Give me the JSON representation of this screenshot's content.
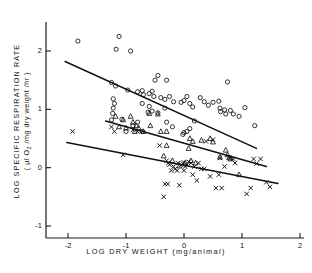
{
  "figure": {
    "xlabel": "LOG  DRY  WEIGHT  (mg/animal)",
    "ylabel_line1": "LOG  SPECIFIC  RESPIRATION  RATE",
    "ylabel_line2": "( µl O2 /mg dry weight /hr )",
    "caption": ""
  },
  "axes": {
    "x_ticks": [
      "-2",
      "-1",
      "0",
      "1",
      "2"
    ],
    "y_ticks": [
      "2",
      "1",
      "0",
      "-1"
    ]
  },
  "chart_data": {
    "type": "scatter",
    "title": "",
    "xlabel": "LOG DRY WEIGHT (mg/animal)",
    "ylabel": "LOG SPECIFIC RESPIRATION RATE (µl O2 /mg dry weight /hr)",
    "xlim": [
      -2.2,
      2.0
    ],
    "ylim": [
      -1.15,
      2.4
    ],
    "grid": false,
    "legend": "none",
    "x_ticks": [
      -2,
      -1,
      0,
      1,
      2
    ],
    "y_ticks": [
      2,
      1,
      0,
      -1
    ],
    "series": [
      {
        "name": "circles",
        "marker": "open-circle",
        "points": [
          [
            -1.83,
            2.17
          ],
          [
            -1.12,
            2.25
          ],
          [
            -1.17,
            2.03
          ],
          [
            -0.92,
            2.0
          ],
          [
            -0.45,
            1.58
          ],
          [
            -0.5,
            1.5
          ],
          [
            -0.3,
            1.5
          ],
          [
            -1.25,
            1.46
          ],
          [
            -1.18,
            1.4
          ],
          [
            -0.97,
            1.33
          ],
          [
            -0.8,
            1.3
          ],
          [
            -0.72,
            1.32
          ],
          [
            -0.7,
            1.25
          ],
          [
            -0.6,
            1.27
          ],
          [
            -0.55,
            1.31
          ],
          [
            -0.52,
            1.22
          ],
          [
            -0.4,
            1.2
          ],
          [
            -0.33,
            1.17
          ],
          [
            -0.25,
            1.22
          ],
          [
            -0.18,
            1.13
          ],
          [
            -1.22,
            1.18
          ],
          [
            -1.2,
            1.1
          ],
          [
            -1.22,
            1.02
          ],
          [
            -1.23,
            0.93
          ],
          [
            -1.25,
            0.82
          ],
          [
            -1.07,
            0.83
          ],
          [
            -1.0,
            0.62
          ],
          [
            -0.88,
            0.72
          ],
          [
            -0.8,
            0.78
          ],
          [
            -0.72,
            0.62
          ],
          [
            -0.62,
            0.95
          ],
          [
            -0.55,
            0.97
          ],
          [
            -0.45,
            0.94
          ],
          [
            -0.33,
            1.02
          ],
          [
            -0.3,
            0.78
          ],
          [
            -0.2,
            0.7
          ],
          [
            -0.05,
            1.12
          ],
          [
            0.0,
            1.15
          ],
          [
            0.05,
            1.22
          ],
          [
            0.1,
            1.1
          ],
          [
            0.15,
            1.04
          ],
          [
            0.18,
            0.8
          ],
          [
            0.1,
            0.67
          ],
          [
            0.05,
            0.62
          ],
          [
            0.0,
            0.6
          ],
          [
            -0.02,
            0.57
          ],
          [
            0.28,
            1.2
          ],
          [
            0.35,
            1.13
          ],
          [
            0.42,
            1.07
          ],
          [
            0.5,
            1.12
          ],
          [
            0.6,
            1.14
          ],
          [
            0.62,
            1.02
          ],
          [
            0.63,
            0.96
          ],
          [
            0.7,
            0.99
          ],
          [
            0.72,
            0.92
          ],
          [
            0.8,
            0.98
          ],
          [
            0.85,
            0.92
          ],
          [
            0.75,
            1.47
          ],
          [
            1.05,
            1.03
          ],
          [
            1.22,
            0.72
          ],
          [
            0.95,
            0.88
          ],
          [
            -0.72,
            1.1
          ],
          [
            -0.6,
            1.05
          ]
        ]
      },
      {
        "name": "triangles",
        "marker": "open-triangle",
        "points": [
          [
            -1.18,
            0.88
          ],
          [
            -1.05,
            0.82
          ],
          [
            -1.12,
            0.7
          ],
          [
            -1.0,
            0.68
          ],
          [
            -0.88,
            0.78
          ],
          [
            -0.85,
            0.62
          ],
          [
            -0.78,
            0.68
          ],
          [
            -0.7,
            0.62
          ],
          [
            -0.6,
            0.93
          ],
          [
            -0.58,
            0.72
          ],
          [
            -0.45,
            0.92
          ],
          [
            -0.4,
            0.62
          ],
          [
            -0.35,
            0.2
          ],
          [
            -0.3,
            0.62
          ],
          [
            -0.2,
            0.12
          ],
          [
            -0.08,
            0.03
          ],
          [
            0.02,
            0.08
          ],
          [
            0.1,
            0.5
          ],
          [
            0.12,
            0.12
          ],
          [
            0.15,
            0.45
          ],
          [
            0.3,
            0.47
          ],
          [
            0.45,
            0.5
          ],
          [
            0.5,
            0.44
          ],
          [
            0.62,
            0.18
          ],
          [
            0.72,
            0.3
          ],
          [
            0.75,
            0.22
          ],
          [
            0.78,
            0.17
          ],
          [
            0.8,
            0.15
          ],
          [
            0.95,
            -0.12
          ],
          [
            -0.82,
            0.72
          ],
          [
            -0.92,
            0.88
          ],
          [
            0.08,
            0.33
          ],
          [
            0.2,
            0.08
          ],
          [
            -0.3,
            0.38
          ]
        ]
      },
      {
        "name": "x-marks",
        "marker": "cross-x",
        "points": [
          [
            -1.92,
            0.62
          ],
          [
            -1.25,
            0.7
          ],
          [
            -1.2,
            0.62
          ],
          [
            -1.05,
            0.22
          ],
          [
            -0.88,
            0.65
          ],
          [
            -0.8,
            0.62
          ],
          [
            -0.35,
            -0.5
          ],
          [
            -0.33,
            -0.28
          ],
          [
            -0.28,
            -0.28
          ],
          [
            -0.3,
            0.12
          ],
          [
            -0.27,
            0.08
          ],
          [
            -0.25,
            0.05
          ],
          [
            -0.22,
            -0.05
          ],
          [
            -0.18,
            0.02
          ],
          [
            -0.15,
            -0.02
          ],
          [
            -0.12,
            -0.05
          ],
          [
            -0.1,
            0.08
          ],
          [
            -0.08,
            -0.3
          ],
          [
            -0.05,
            0.05
          ],
          [
            -0.02,
            0.07
          ],
          [
            0.0,
            0.09
          ],
          [
            0.02,
            0.02
          ],
          [
            0.05,
            0.05
          ],
          [
            0.08,
            0.1
          ],
          [
            0.12,
            0.08
          ],
          [
            0.15,
            -0.12
          ],
          [
            0.22,
            -0.22
          ],
          [
            0.25,
            0.08
          ],
          [
            0.3,
            -0.02
          ],
          [
            0.38,
            0.45
          ],
          [
            0.45,
            -0.15
          ],
          [
            0.5,
            0.48
          ],
          [
            0.55,
            -0.35
          ],
          [
            0.6,
            -0.12
          ],
          [
            0.62,
            0.17
          ],
          [
            0.65,
            -0.35
          ],
          [
            0.7,
            0.02
          ],
          [
            0.78,
            0.18
          ],
          [
            0.85,
            0.15
          ],
          [
            0.88,
            0.08
          ],
          [
            1.08,
            -0.45
          ],
          [
            1.15,
            -0.35
          ],
          [
            1.2,
            0.15
          ],
          [
            1.25,
            0.07
          ],
          [
            1.32,
            0.15
          ],
          [
            1.42,
            -0.25
          ],
          [
            1.48,
            -0.33
          ],
          [
            -0.42,
            0.38
          ],
          [
            0.0,
            -0.05
          ],
          [
            0.35,
            -0.02
          ],
          [
            0.18,
            0.02
          ]
        ]
      }
    ],
    "fit_lines": [
      {
        "name": "circles-fit",
        "x0": -2.05,
        "y0": 1.82,
        "x1": 1.25,
        "y1": 0.33
      },
      {
        "name": "triangles-fit",
        "x0": -1.35,
        "y0": 0.8,
        "x1": 1.42,
        "y1": 0.02
      },
      {
        "name": "x-marks-fit",
        "x0": -2.02,
        "y0": 0.43,
        "x1": 1.62,
        "y1": -0.27
      }
    ]
  }
}
